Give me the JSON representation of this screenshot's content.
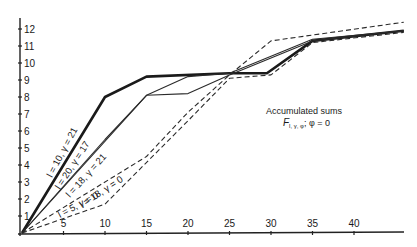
{
  "chart_data": {
    "type": "line",
    "title": "",
    "xlabel": "",
    "ylabel": "",
    "xlim": [
      0,
      46
    ],
    "ylim": [
      0,
      12.5
    ],
    "grid": false,
    "x_ticks": [
      5,
      10,
      15,
      20,
      25,
      30,
      35,
      40
    ],
    "y_ticks": [
      1,
      2,
      3,
      4,
      5,
      6,
      7,
      8,
      9,
      10,
      11,
      12
    ],
    "annotation": {
      "line1": "Accumulated sums",
      "line2": "F",
      "line2_sub": "l, γ, φ",
      "line2_rest": "; φ = 0"
    },
    "series": [
      {
        "name": "l = 10, γ = 21",
        "style": "thick-solid",
        "points": [
          [
            0,
            0
          ],
          [
            10,
            8.0
          ],
          [
            15,
            9.2
          ],
          [
            25,
            9.4
          ],
          [
            29.5,
            9.4
          ],
          [
            35,
            11.3
          ],
          [
            46,
            11.9
          ]
        ]
      },
      {
        "name": "l = 20, γ = 17",
        "style": "solid",
        "points": [
          [
            0,
            0
          ],
          [
            15,
            8.1
          ],
          [
            20,
            9.2
          ],
          [
            25,
            9.4
          ],
          [
            35,
            11.4
          ],
          [
            46,
            11.9
          ]
        ]
      },
      {
        "name": "l = 18, γ = 21",
        "style": "solid",
        "points": [
          [
            0,
            0
          ],
          [
            10,
            5.5
          ],
          [
            15,
            8.1
          ],
          [
            20,
            8.2
          ],
          [
            25,
            9.3
          ],
          [
            35,
            11.3
          ],
          [
            46,
            11.9
          ]
        ]
      },
      {
        "name": "l = 18, γ = 0",
        "style": "dashed",
        "points": [
          [
            0,
            0
          ],
          [
            15,
            4.5
          ],
          [
            20,
            7.1
          ],
          [
            25,
            9.3
          ],
          [
            30,
            11.3
          ],
          [
            46,
            12.4
          ]
        ]
      },
      {
        "name": "l = 5, γ = 0",
        "style": "dashed",
        "points": [
          [
            0,
            0
          ],
          [
            10,
            1.7
          ],
          [
            20,
            6.6
          ],
          [
            25,
            9.1
          ],
          [
            30,
            9.3
          ],
          [
            35,
            11.2
          ],
          [
            46,
            11.8
          ]
        ]
      }
    ]
  }
}
